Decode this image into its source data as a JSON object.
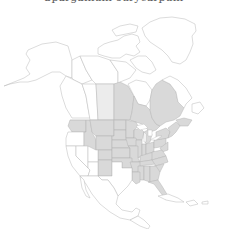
{
  "title": "Sparganium eurycarpum",
  "map": {
    "region": "North America",
    "colors": {
      "present": "#d9d9d9",
      "present_light": "#ececec",
      "absent": "#ffffff",
      "border": "#b9b9b9"
    },
    "shaded_regions": [
      "Manitoba",
      "Ontario",
      "Quebec",
      "New Brunswick",
      "Nova Scotia",
      "Washington",
      "Idaho",
      "Montana",
      "Wyoming",
      "Colorado",
      "New Mexico",
      "North Dakota",
      "South Dakota",
      "Nebraska",
      "Kansas",
      "Oklahoma",
      "Minnesota",
      "Iowa",
      "Missouri",
      "Arkansas",
      "Louisiana",
      "Wisconsin",
      "Illinois",
      "Michigan",
      "Indiana",
      "Ohio",
      "Kentucky",
      "Tennessee",
      "Mississippi",
      "Alabama",
      "Georgia",
      "Florida",
      "South Carolina",
      "North Carolina",
      "Virginia",
      "West Virginia",
      "Maryland",
      "Pennsylvania",
      "New York",
      "New Jersey",
      "Delaware",
      "Connecticut",
      "Rhode Island",
      "Massachusetts",
      "Vermont",
      "New Hampshire",
      "Maine"
    ],
    "lightly_shaded_regions": [
      "Saskatchewan"
    ],
    "unshaded_regions": [
      "Alaska",
      "Yukon",
      "Northwest Territories",
      "Nunavut",
      "British Columbia",
      "Alberta",
      "Newfoundland and Labrador",
      "Greenland",
      "Oregon",
      "California",
      "Nevada",
      "Utah",
      "Arizona",
      "Texas",
      "Mexico",
      "Central America",
      "Caribbean"
    ]
  }
}
